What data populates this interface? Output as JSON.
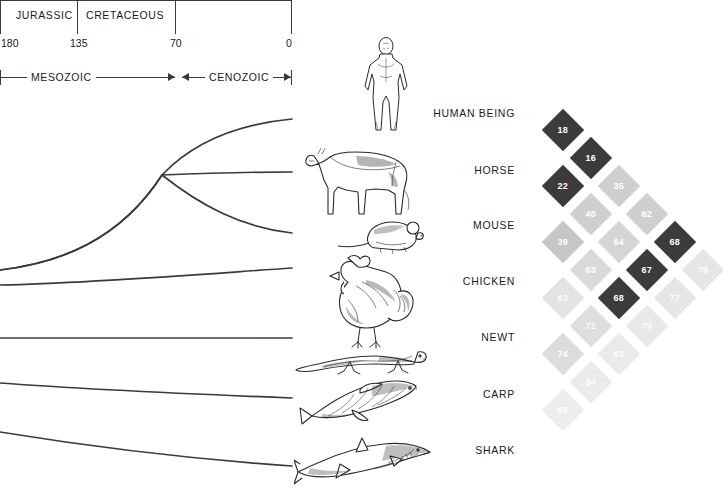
{
  "timeline": {
    "periods": [
      {
        "name": "JURASSIC"
      },
      {
        "name": "CRETACEOUS"
      }
    ],
    "ticks": [
      {
        "label": "180",
        "mya": 180
      },
      {
        "label": "135",
        "mya": 135
      },
      {
        "label": "70",
        "mya": 70
      },
      {
        "label": "0",
        "mya": 0
      }
    ],
    "eras": [
      {
        "name": "MESOZOIC"
      },
      {
        "name": "CENOZOIC"
      }
    ]
  },
  "organisms": [
    {
      "name": "HUMAN BEING",
      "icon": "human-figure-icon"
    },
    {
      "name": "HORSE",
      "icon": "horse-icon"
    },
    {
      "name": "MOUSE",
      "icon": "mouse-icon"
    },
    {
      "name": "CHICKEN",
      "icon": "chicken-icon"
    },
    {
      "name": "NEWT",
      "icon": "newt-icon"
    },
    {
      "name": "CARP",
      "icon": "carp-icon"
    },
    {
      "name": "SHARK",
      "icon": "shark-icon"
    }
  ],
  "colors": {
    "dark": "#3b3b3b",
    "mid": "#b5b5b5",
    "light": "#cfcfcf",
    "pale": "#e0e0e0",
    "faint": "#ececec",
    "line": "#3a3a3a",
    "text": "#1a1a1a"
  },
  "chart_data": {
    "type": "heatmap",
    "xlabel": "",
    "ylabel": "",
    "grid": false,
    "legend": "none",
    "orientation": "diagonal-45",
    "categories": [
      "HUMAN BEING",
      "HORSE",
      "MOUSE",
      "CHICKEN",
      "NEWT",
      "CARP",
      "SHARK"
    ],
    "rows": [
      {
        "species": "HUMAN BEING",
        "values": [
          18,
          16,
          22,
          39,
          63,
          85
        ]
      },
      {
        "species": "HORSE",
        "values": [
          35,
          40,
          63,
          74,
          84
        ]
      },
      {
        "species": "MOUSE",
        "values": [
          62,
          64,
          72,
          83
        ]
      },
      {
        "species": "CHICKEN",
        "values": [
          68,
          67,
          79
        ]
      },
      {
        "species": "NEWT",
        "values": [
          68,
          77
        ]
      },
      {
        "species": "CARP",
        "values": [
          79
        ]
      }
    ],
    "cells": [
      {
        "value": 18,
        "pair": [
          "HUMAN BEING",
          "HORSE"
        ],
        "shade": "dark",
        "color": "#3b3b3b",
        "x": 563,
        "y": 130
      },
      {
        "value": 16,
        "pair": [
          "HORSE",
          "MOUSE"
        ],
        "shade": "dark",
        "color": "#3b3b3b",
        "x": 591,
        "y": 158
      },
      {
        "value": 22,
        "pair": [
          "HUMAN BEING",
          "MOUSE"
        ],
        "shade": "dark",
        "color": "#3b3b3b",
        "x": 563,
        "y": 186
      },
      {
        "value": 35,
        "pair": [
          "HORSE",
          "CHICKEN"
        ],
        "shade": "light",
        "color": "#cfcfcf",
        "x": 619,
        "y": 186
      },
      {
        "value": 40,
        "pair": [
          "MOUSE",
          "CHICKEN"
        ],
        "shade": "light",
        "color": "#cfcfcf",
        "x": 591,
        "y": 214
      },
      {
        "value": 62,
        "pair": [
          "CHICKEN",
          "NEWT"
        ],
        "shade": "light",
        "color": "#cfcfcf",
        "x": 647,
        "y": 214
      },
      {
        "value": 39,
        "pair": [
          "HUMAN BEING",
          "CHICKEN"
        ],
        "shade": "mid",
        "color": "#c6c6c6",
        "x": 563,
        "y": 242
      },
      {
        "value": 64,
        "pair": [
          "MOUSE",
          "NEWT"
        ],
        "shade": "light",
        "color": "#d5d5d5",
        "x": 619,
        "y": 242
      },
      {
        "value": 68,
        "pair": [
          "CHICKEN",
          "CARP"
        ],
        "shade": "dark",
        "color": "#3b3b3b",
        "x": 675,
        "y": 242
      },
      {
        "value": 63,
        "pair": [
          "HORSE",
          "NEWT"
        ],
        "shade": "pale",
        "color": "#dadada",
        "x": 591,
        "y": 270
      },
      {
        "value": 67,
        "pair": [
          "NEWT",
          "CARP"
        ],
        "shade": "dark",
        "color": "#3b3b3b",
        "x": 647,
        "y": 270
      },
      {
        "value": 79,
        "pair": [
          "CARP",
          "SHARK"
        ],
        "shade": "faint",
        "color": "#e6e6e6",
        "x": 703,
        "y": 270
      },
      {
        "value": 63,
        "pair": [
          "HUMAN BEING",
          "NEWT"
        ],
        "shade": "faint",
        "color": "#e3e3e3",
        "x": 563,
        "y": 298
      },
      {
        "value": 68,
        "pair": [
          "MOUSE",
          "CARP"
        ],
        "shade": "dark",
        "color": "#3b3b3b",
        "x": 619,
        "y": 298
      },
      {
        "value": 77,
        "pair": [
          "NEWT",
          "SHARK"
        ],
        "shade": "faint",
        "color": "#e6e6e6",
        "x": 675,
        "y": 298
      },
      {
        "value": 72,
        "pair": [
          "HORSE",
          "CARP"
        ],
        "shade": "pale",
        "color": "#dedede",
        "x": 591,
        "y": 326
      },
      {
        "value": 79,
        "pair": [
          "CHICKEN",
          "SHARK"
        ],
        "shade": "faint",
        "color": "#e8e8e8",
        "x": 647,
        "y": 326
      },
      {
        "value": 74,
        "pair": [
          "HUMAN BEING",
          "CARP"
        ],
        "shade": "pale",
        "color": "#dcdcdc",
        "x": 563,
        "y": 354
      },
      {
        "value": 83,
        "pair": [
          "MOUSE",
          "SHARK"
        ],
        "shade": "faint",
        "color": "#eaeaea",
        "x": 619,
        "y": 354
      },
      {
        "value": 84,
        "pair": [
          "HORSE",
          "SHARK"
        ],
        "shade": "faint",
        "color": "#ebebeb",
        "x": 591,
        "y": 382
      },
      {
        "value": 85,
        "pair": [
          "HUMAN BEING",
          "SHARK"
        ],
        "shade": "faint",
        "color": "#ededed",
        "x": 563,
        "y": 410
      }
    ]
  }
}
